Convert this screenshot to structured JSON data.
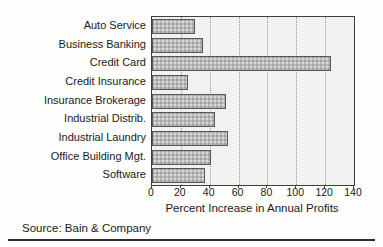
{
  "source": "Source: Bain & Company",
  "chart_data": {
    "type": "bar",
    "orientation": "horizontal",
    "categories": [
      "Auto Service",
      "Business Banking",
      "Credit Card",
      "Credit Insurance",
      "Insurance Brokerage",
      "Industrial Distrib.",
      "Industrial Laundry",
      "Office Building Mgt.",
      "Software"
    ],
    "values": [
      30,
      35,
      124,
      25,
      51,
      44,
      53,
      41,
      37
    ],
    "title": "",
    "xlabel": "Percent Increase in Annual Profits",
    "ylabel": "",
    "xlim": [
      0,
      140
    ],
    "xticks": [
      0,
      20,
      40,
      60,
      80,
      100,
      120,
      140
    ],
    "grid": "vertical-dotted-at-xticks",
    "legend": "none",
    "bar_color": "#b9b9b9",
    "bar_border_color": "#585858",
    "plot_bg": "#f1f1ef",
    "axis_color": "#3f3f3f"
  }
}
